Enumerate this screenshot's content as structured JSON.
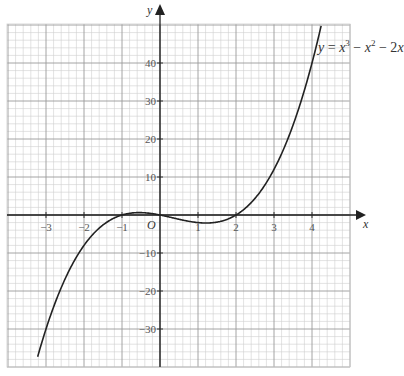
{
  "chart_data": {
    "type": "line",
    "title": "",
    "equation_label": {
      "prefix": "y",
      "eq": " = ",
      "t1": "x",
      "t1_exp": "3",
      "minus1": " − ",
      "t2": "x",
      "t2_exp": "2",
      "minus2": " − 2",
      "t3": "x"
    },
    "xlabel": "x",
    "ylabel": "y",
    "origin_label": "O",
    "xlim": [
      -3.4,
      5.6
    ],
    "ylim": [
      -40.5,
      50.5
    ],
    "x_ticks": [
      -3,
      -2,
      -1,
      1,
      2,
      3,
      4
    ],
    "x_tick_labels": [
      "−3",
      "−2",
      "−1",
      "1",
      "2",
      "3",
      "4"
    ],
    "y_ticks": [
      40,
      30,
      20,
      10,
      -10,
      -20,
      -30
    ],
    "y_tick_labels": [
      "40",
      "30",
      "20",
      "10",
      "−10",
      "−20",
      "−30"
    ],
    "grid": true,
    "grid_minor_divisions": 5,
    "series": [
      {
        "name": "y = x^3 - x^2 - 2x",
        "x": [
          -3.2,
          -3,
          -2.5,
          -2,
          -1.5,
          -1,
          -0.5,
          0,
          0.5,
          1,
          1.5,
          2,
          2.5,
          3,
          3.5,
          4,
          4.2
        ],
        "values": [
          -36.64,
          -30,
          -16.88,
          -8,
          -2.63,
          0,
          0.63,
          0,
          -1.13,
          -2,
          -1.13,
          0,
          3.13,
          12,
          23.63,
          40,
          46.3
        ]
      }
    ],
    "colors": {
      "grid_minor": "#cfcfcf",
      "grid_major": "#9a9a9a",
      "axis": "#222222",
      "curve": "#222222"
    }
  }
}
